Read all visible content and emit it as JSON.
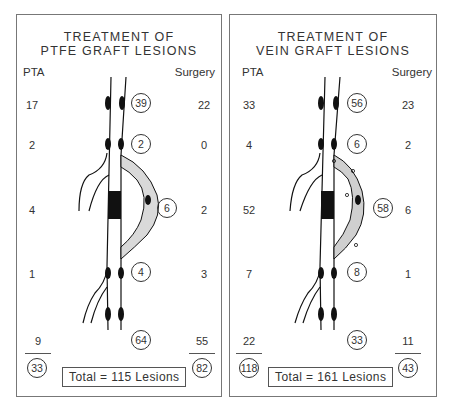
{
  "panels": [
    {
      "title_line1": "TREATMENT OF",
      "title_line2": "PTFE GRAFT LESIONS",
      "pta_header": "PTA",
      "surgery_header": "Surgery",
      "rows": [
        {
          "pta": "17",
          "total": "39",
          "surgery": "22"
        },
        {
          "pta": "2",
          "total": "2",
          "surgery": "0"
        },
        {
          "pta": "4",
          "total": "6",
          "surgery": "2"
        },
        {
          "pta": "1",
          "total": "4",
          "surgery": "3"
        },
        {
          "pta": "9",
          "total": "64",
          "surgery": "55"
        }
      ],
      "pta_sum": "33",
      "surgery_sum": "82",
      "total_label": "Total = 115  Lesions",
      "graft_fill": "#d9d9d9"
    },
    {
      "title_line1": "TREATMENT OF",
      "title_line2": "VEIN GRAFT LESIONS",
      "pta_header": "PTA",
      "surgery_header": "Surgery",
      "rows": [
        {
          "pta": "33",
          "total": "56",
          "surgery": "23"
        },
        {
          "pta": "4",
          "total": "6",
          "surgery": "2"
        },
        {
          "pta": "52",
          "total": "58",
          "surgery": "6"
        },
        {
          "pta": "7",
          "total": "8",
          "surgery": "1"
        },
        {
          "pta": "22",
          "total": "33",
          "surgery": "11"
        }
      ],
      "pta_sum": "118",
      "surgery_sum": "43",
      "total_label": "Total = 161  Lesions",
      "graft_fill": "#cfcfcf"
    }
  ]
}
